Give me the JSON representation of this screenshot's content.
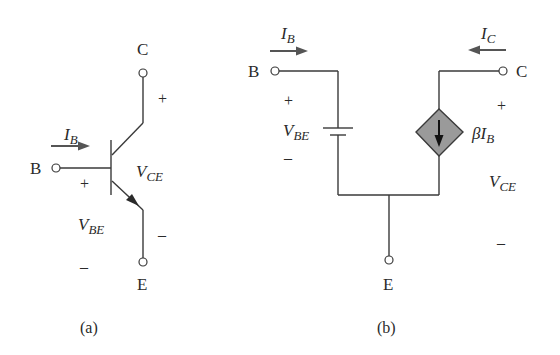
{
  "figure_a": {
    "caption": "(a)",
    "terminals": {
      "collector": "C",
      "base": "B",
      "emitter": "E"
    },
    "base_current": {
      "symbol": "I",
      "subscript": "B"
    },
    "vce": {
      "symbol": "V",
      "subscript": "CE",
      "plus": "+",
      "minus": "–"
    },
    "vbe": {
      "symbol": "V",
      "subscript": "BE",
      "plus": "+",
      "minus": "–"
    }
  },
  "figure_b": {
    "caption": "(b)",
    "terminals": {
      "collector": "C",
      "base": "B",
      "emitter": "E"
    },
    "base_current": {
      "symbol": "I",
      "subscript": "B"
    },
    "collector_current": {
      "symbol": "I",
      "subscript": "C"
    },
    "vbe": {
      "symbol": "V",
      "subscript": "BE",
      "plus": "+",
      "minus": "–"
    },
    "vce": {
      "symbol": "V",
      "subscript": "CE",
      "plus": "+",
      "minus": "–"
    },
    "dependent_source": {
      "prefix": "β",
      "symbol": "I",
      "subscript": "B",
      "fill": "#9a9a9a"
    }
  }
}
